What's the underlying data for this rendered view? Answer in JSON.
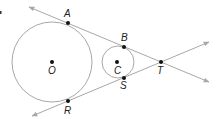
{
  "diagram": {
    "type": "two circles with common external tangents",
    "colors": {
      "line": "#a8a8a8",
      "point": "#111111",
      "label": "#222222"
    },
    "circles": [
      {
        "name": "O",
        "cx": 52,
        "cy": 62,
        "r": 40
      },
      {
        "name": "C",
        "cx": 118,
        "cy": 62,
        "r": 16
      }
    ],
    "points": [
      {
        "label": "A",
        "x": 68,
        "y": 23,
        "lx": 64,
        "ly": 17
      },
      {
        "label": "B",
        "x": 124,
        "y": 47,
        "lx": 121,
        "ly": 41
      },
      {
        "label": "O",
        "x": 52,
        "y": 62,
        "lx": 48,
        "ly": 74
      },
      {
        "label": "C",
        "x": 117,
        "y": 62,
        "lx": 114,
        "ly": 74
      },
      {
        "label": "T",
        "x": 161,
        "y": 62,
        "lx": 157,
        "ly": 74
      },
      {
        "label": "S",
        "x": 124,
        "y": 78,
        "lx": 120,
        "ly": 89
      },
      {
        "label": "R",
        "x": 68,
        "y": 101,
        "lx": 64,
        "ly": 114
      }
    ],
    "lines": [
      {
        "name": "tangent-ABT",
        "x1": 29,
        "y1": 7,
        "x2": 209,
        "y2": 82
      },
      {
        "name": "tangent-RST",
        "x1": 32,
        "y1": 116,
        "x2": 209,
        "y2": 42
      }
    ]
  }
}
